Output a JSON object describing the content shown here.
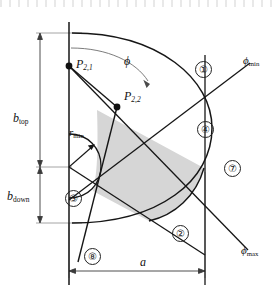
{
  "figure": {
    "background_color": "#ffffff",
    "line_color": "#1a1a1a",
    "shaded_region_color": "#d4d4d4",
    "dimension_line_color": "#7a7a7a"
  },
  "labels": {
    "b_top": {
      "base": "b",
      "sub": "top"
    },
    "b_down": {
      "base": "b",
      "sub": "down"
    },
    "r_min": {
      "base": "r",
      "sub": "min"
    },
    "a": {
      "base": "a"
    },
    "phi": {
      "base": "ϕ"
    },
    "phi_min": {
      "base": "ϕ",
      "sub": "min"
    },
    "phi_max": {
      "base": "ϕ",
      "sub": "max"
    },
    "p21": {
      "base": "P",
      "sub": "2,1"
    },
    "p22": {
      "base": "P",
      "sub": "2,2"
    }
  },
  "callouts": [
    {
      "id": "callout-1",
      "text": "①",
      "number": "1"
    },
    {
      "id": "callout-2",
      "text": "②",
      "number": "2"
    },
    {
      "id": "callout-3",
      "text": "③",
      "number": "3"
    },
    {
      "id": "callout-4",
      "text": "④",
      "number": "4"
    },
    {
      "id": "callout-7",
      "text": "⑦",
      "number": "7"
    },
    {
      "id": "callout-8",
      "text": "⑧",
      "number": "8"
    }
  ],
  "points": [
    {
      "name": "p21",
      "label": "P2,1"
    },
    {
      "name": "p22",
      "label": "P2,2"
    },
    {
      "name": "origin",
      "label": "origin"
    }
  ]
}
